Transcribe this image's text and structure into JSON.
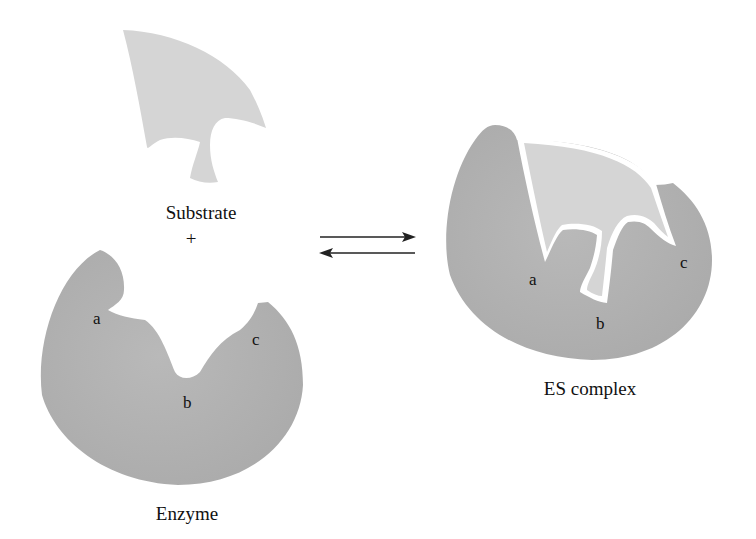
{
  "diagram": {
    "colors": {
      "enzyme_fill": "#b1b1b1",
      "substrate_fill": "#d5d5d5",
      "gap": "#ffffff",
      "arrow": "#222222",
      "text": "#111111"
    },
    "left": {
      "substrate_label": "Substrate",
      "plus": "+",
      "enzyme_label": "Enzyme",
      "sites": {
        "a": "a",
        "b": "b",
        "c": "c"
      }
    },
    "arrows": {
      "forward": "→",
      "reverse": "←"
    },
    "right": {
      "complex_label": "ES complex",
      "sites": {
        "a": "a",
        "b": "b",
        "c": "c"
      }
    }
  }
}
